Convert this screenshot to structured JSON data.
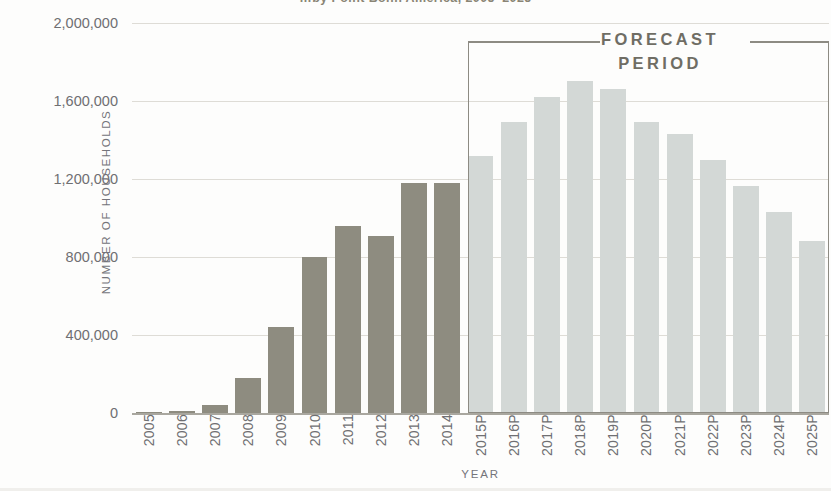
{
  "chart_data": {
    "type": "bar",
    "title": "…by Point Bonn America, 2005–2025",
    "xlabel": "YEAR",
    "ylabel": "NUMBER OF HOUSEHOLDS",
    "ylim": [
      0,
      2000000
    ],
    "grid": true,
    "legend_position": "none",
    "y_ticks": [
      {
        "value": 2000000,
        "label": "2,000,000"
      },
      {
        "value": 1600000,
        "label": "1,600,000"
      },
      {
        "value": 1200000,
        "label": "1,200,000"
      },
      {
        "value": 800000,
        "label": "800,000"
      },
      {
        "value": 400000,
        "label": "400,000"
      },
      {
        "value": 0,
        "label": "0"
      }
    ],
    "categories": [
      "2005",
      "2006",
      "2007",
      "2008",
      "2009",
      "2010",
      "2011",
      "2012",
      "2013",
      "2014",
      "2015P",
      "2016P",
      "2017P",
      "2018P",
      "2019P",
      "2020P",
      "2021P",
      "2022P",
      "2023P",
      "2024P",
      "2025P"
    ],
    "values": [
      2000,
      8000,
      40000,
      180000,
      440000,
      800000,
      960000,
      910000,
      1180000,
      1180000,
      1320000,
      1490000,
      1620000,
      1705000,
      1660000,
      1490000,
      1430000,
      1300000,
      1165000,
      1030000,
      880000
    ],
    "series": [
      {
        "name": "Number of households",
        "values": [
          2000,
          8000,
          40000,
          180000,
          440000,
          800000,
          960000,
          910000,
          1180000,
          1180000,
          1320000,
          1490000,
          1620000,
          1705000,
          1660000,
          1490000,
          1430000,
          1300000,
          1165000,
          1030000,
          880000
        ]
      }
    ],
    "segments": [
      {
        "name": "historical",
        "from": "2005",
        "to": "2014",
        "color": "#8e8c80"
      },
      {
        "name": "forecast",
        "from": "2015P",
        "to": "2025P",
        "color": "#d3d8d6"
      }
    ],
    "annotations": [
      {
        "name": "forecast-period",
        "text": "FORECAST PERIOD",
        "from": "2015P",
        "to": "2025P"
      }
    ]
  },
  "annotation": {
    "forecast_line1": "FORECAST",
    "forecast_line2": "PERIOD"
  },
  "colors": {
    "historical_bar": "#8e8c80",
    "forecast_bar": "#d3d8d6",
    "gridline": "#dedcd6",
    "axis": "#a9a79f",
    "text": "#6f6f72",
    "annotation": "#6f6d64"
  }
}
